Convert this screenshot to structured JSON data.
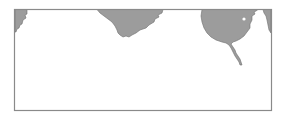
{
  "map": {
    "width": 283,
    "height": 120,
    "background": "#ffffff",
    "frame": {
      "x": 14.5,
      "y": 9.5,
      "width": 257,
      "height": 101,
      "stroke": "#8a8a8a",
      "stroke_width": 1.2
    },
    "land_fill": "#9c9c9c",
    "coast_stroke": "#6e6e6e",
    "water_fill": "#ffffff",
    "landmasses": [
      {
        "name": "left-edge-landmass",
        "path": "M15,9.5 L27,9.5 L27,14 L25,15 L26,18 L23,20 L22,24 L20,25 L19,28 L17,29 L16,32 L15,32 Z"
      },
      {
        "name": "central-peninsula",
        "path": "M97,9.5 L163,9.5 L162,13 L158,15 L159,17 L155,19 L154,22 L149,25 L146,28 L140,30 L136,33 L132,35 L129,37 L126,36 L123,37 L120,35 L118,33 L117,30 L115,26 L112,22 L108,19 L104,16 L100,13 Z"
      },
      {
        "name": "eastern-landmass",
        "path": "M202,9.5 L258,9.5 L256,11 L254,12 L255,14 L252,16 L252,20 L250,24 L250,28 L247,32 L244,36 L240,39 L236,41 L233,42 L231,44 L233,47 L235,50 L236,53 L238,56 L240,59 L241,62 L242,65 L240,65 L239,62 L237,59 L235,56 L233,52 L231,48 L229,45 L226,43 L222,42 L216,40 L211,37 L207,33 L204,28 L202,22 L201,16 Z"
      },
      {
        "name": "right-edge-sliver",
        "path": "M263,9.5 L271,9.5 L271,33 L269,30 L268,25 L267,20 L266,16 L264,13 Z"
      }
    ],
    "lakes": [
      {
        "name": "inland-lake",
        "cx": 244,
        "cy": 19,
        "r": 1.6
      }
    ]
  }
}
